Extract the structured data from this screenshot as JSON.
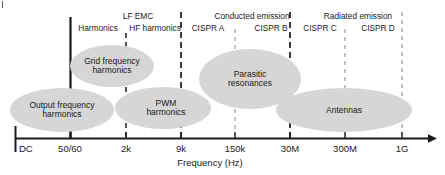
{
  "figure": {
    "axis_title": "Frequency (Hz)",
    "axis": {
      "y": 138,
      "x_start": 15,
      "x_end": 432
    },
    "ticks": [
      {
        "label": "DC",
        "x": 20,
        "anchor": "left",
        "marker": "none"
      },
      {
        "label": "50/60",
        "x": 70,
        "anchor": "center",
        "marker": "solid"
      },
      {
        "label": "2k",
        "x": 126,
        "anchor": "center",
        "marker": "dashed-dark"
      },
      {
        "label": "9k",
        "x": 181,
        "anchor": "center",
        "marker": "dashed-dark"
      },
      {
        "label": "150k",
        "x": 235,
        "anchor": "center",
        "marker": "dashed-light"
      },
      {
        "label": "30M",
        "x": 290,
        "anchor": "center",
        "marker": "dashed-dark"
      },
      {
        "label": "300M",
        "x": 345,
        "anchor": "center",
        "marker": "dashed-light"
      },
      {
        "label": "1G",
        "x": 402,
        "anchor": "center",
        "marker": "dashed-light"
      }
    ],
    "band_labels": [
      {
        "text": "LF EMC",
        "x": 138,
        "y": 13
      },
      {
        "text": "Conducted emission",
        "x": 252,
        "y": 13
      },
      {
        "text": "Radiated emission",
        "x": 358,
        "y": 13
      }
    ],
    "sub_labels": [
      {
        "text": "Harmonics",
        "x": 98,
        "y": 25
      },
      {
        "text": "HF harmonics",
        "x": 155,
        "y": 25
      },
      {
        "text": "CISPR A",
        "x": 208,
        "y": 25
      },
      {
        "text": "CISPR B",
        "x": 271,
        "y": 25
      },
      {
        "text": "CISPR C",
        "x": 320,
        "y": 25
      },
      {
        "text": "CISPR D",
        "x": 378,
        "y": 25
      }
    ],
    "regions": [
      {
        "name": "output-frequency-harmonics",
        "line1": "Output frequency",
        "line2": "harmonics",
        "cx": 62,
        "cy": 110,
        "rx": 52,
        "ry": 22
      },
      {
        "name": "grid-frequency-harmonics",
        "line1": "Grid frequency",
        "line2": "harmonics",
        "cx": 112,
        "cy": 66,
        "rx": 42,
        "ry": 21
      },
      {
        "name": "pwm-harmonics",
        "line1": "PWM",
        "line2": "harmonics",
        "cx": 163,
        "cy": 108,
        "rx": 48,
        "ry": 21
      },
      {
        "name": "parasitic-resonances",
        "line1": "Parasitic",
        "line2": "resonances",
        "cx": 250,
        "cy": 79,
        "rx": 51,
        "ry": 30
      },
      {
        "name": "antennas",
        "line1": "Antennas",
        "line2": "",
        "cx": 344,
        "cy": 110,
        "rx": 68,
        "ry": 22
      }
    ],
    "colors": {
      "ellipse_fill": "#d6d6d6",
      "axis": "#1a1a1a",
      "text": "#1a1a1a",
      "dash_dark": "#1a1a1a",
      "dash_light": "#9a9a9a",
      "background": "#ffffff"
    }
  }
}
